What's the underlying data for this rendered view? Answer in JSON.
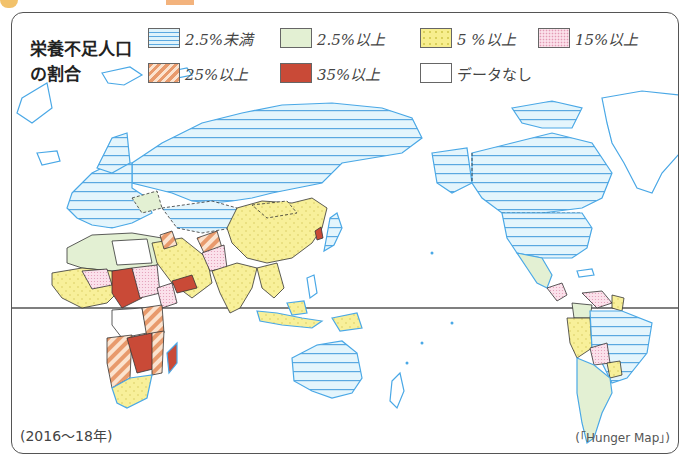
{
  "legend": {
    "title_line1": "栄養不足人口",
    "title_line2": "の割合",
    "items": [
      {
        "label": "2.5%未満",
        "pattern": "horizontal-lines",
        "color": "#dff3fb"
      },
      {
        "label": "2.5%以上",
        "pattern": "solid",
        "color": "#e3f0d3"
      },
      {
        "label": "5 %以上",
        "pattern": "dots",
        "color": "#f7ee8e"
      },
      {
        "label": "15%以上",
        "pattern": "fine-dots",
        "color": "#fbe0ea"
      },
      {
        "label": "25%以上",
        "pattern": "diagonal-stripes",
        "color": "#e89a6c"
      },
      {
        "label": "35%以上",
        "pattern": "solid",
        "color": "#c94a37"
      },
      {
        "label": "データなし",
        "pattern": "none",
        "color": "#ffffff"
      }
    ]
  },
  "footnote": {
    "period": "(2016～18年)",
    "source": "(「Hunger Map」)"
  },
  "colors": {
    "coastline": "#4aa8e6",
    "border": "#333333",
    "equator": "#555555",
    "frame": "#555555"
  }
}
